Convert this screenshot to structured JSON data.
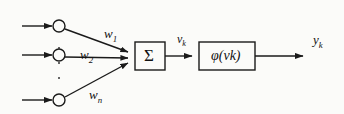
{
  "figure": {
    "background_color": "#fbfbf9",
    "line_color": "#1a1a1a",
    "text_color": "#111111"
  },
  "inputs": [
    {
      "id": "input-1",
      "name": "input-arrow-1",
      "y": 26
    },
    {
      "id": "input-2",
      "name": "input-arrow-2",
      "y": 55
    },
    {
      "id": "input-n",
      "name": "input-arrow-n",
      "y": 100
    }
  ],
  "synapses": [
    {
      "id": "synapse-1",
      "name": "synapse-node-1",
      "cx": 59,
      "cy": 26,
      "r": 6
    },
    {
      "id": "synapse-2",
      "name": "synapse-node-2",
      "cx": 59,
      "cy": 55,
      "r": 6
    },
    {
      "id": "synapse-n",
      "name": "synapse-node-n",
      "cx": 59,
      "cy": 100,
      "r": 6
    }
  ],
  "weights": [
    {
      "base": "w",
      "subscript": "1",
      "x": 104,
      "y": 27
    },
    {
      "base": "w",
      "subscript": "2",
      "x": 80,
      "y": 48
    },
    {
      "base": "w",
      "subscript": "n",
      "x": 89,
      "y": 88
    }
  ],
  "vertical_dots": [
    {
      "x": 58,
      "y": 47
    },
    {
      "x": 58,
      "y": 62
    },
    {
      "x": 58,
      "y": 77
    }
  ],
  "summing_junction": {
    "name": "summing-junction-box",
    "symbol": "Σ",
    "x": 135,
    "y": 42,
    "width": 30,
    "height": 28
  },
  "activation": {
    "name": "activation-function-box",
    "symbol": "φ(v",
    "symbol_sub": "k",
    "symbol_tail": ")",
    "x": 199,
    "y": 42,
    "width": 56,
    "height": 28
  },
  "induced_field": {
    "name": "induced-local-field-label",
    "base": "v",
    "subscript": "k",
    "x": 177,
    "y": 33
  },
  "output": {
    "name": "output-signal-label",
    "base": "y",
    "subscript": "k",
    "x": 313,
    "y": 33
  }
}
